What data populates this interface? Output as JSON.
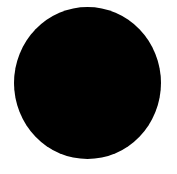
{
  "canvas": {
    "background": "#ffffff"
  },
  "shape": {
    "type": "circle",
    "fill": "#000000"
  }
}
